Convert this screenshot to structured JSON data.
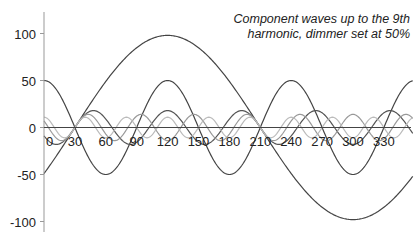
{
  "chart_data": {
    "type": "line",
    "title": "",
    "annotation": [
      "Component waves up to the 9th",
      "harmonic, dimmer set at 50%"
    ],
    "xlabel": "",
    "ylabel": "",
    "xlim": [
      0,
      360
    ],
    "ylim": [
      -110,
      120
    ],
    "x_ticks": [
      0,
      30,
      60,
      90,
      120,
      150,
      180,
      210,
      240,
      270,
      300,
      330
    ],
    "y_ticks": [
      100,
      50,
      0,
      -50,
      -100
    ],
    "grid": false,
    "legend": null,
    "series": [
      {
        "name": "Fundamental",
        "harmonic": 1,
        "amplitude": 98,
        "phase_deg": -30,
        "color": "#444444",
        "values_at_ticks": [
          -49,
          0,
          49,
          85,
          98,
          85,
          49,
          0,
          -49,
          -85,
          -98,
          -85
        ]
      },
      {
        "name": "3rd harmonic",
        "harmonic": 3,
        "amplitude": 50,
        "phase_deg": 90,
        "color": "#444444",
        "values_at_ticks": [
          50,
          0,
          -50,
          0,
          50,
          0,
          -50,
          0,
          50,
          0,
          -50,
          0
        ]
      },
      {
        "name": "5th harmonic",
        "harmonic": 5,
        "amplitude": 18,
        "phase_deg": -150,
        "color": "#555555"
      },
      {
        "name": "7th harmonic",
        "harmonic": 7,
        "amplitude": 14,
        "phase_deg": 150,
        "color": "#999999"
      },
      {
        "name": "9th harmonic",
        "harmonic": 9,
        "amplitude": 11,
        "phase_deg": 90,
        "color": "#bbbbbb"
      }
    ]
  },
  "axes": {
    "x_axis_color": "#444444",
    "y_axis_color": "#999999"
  }
}
